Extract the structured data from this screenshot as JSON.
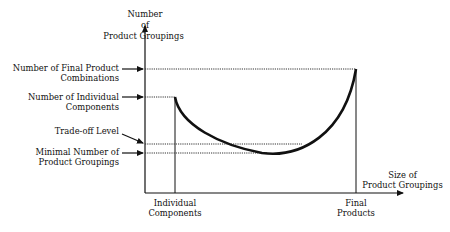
{
  "diagram": {
    "y_axis_title": [
      "Number",
      "of",
      "Product Groupings"
    ],
    "x_axis_title": [
      "Size of",
      "Product Groupings"
    ],
    "y_labels": {
      "final_combinations": [
        "Number of Final Product",
        "Combinations"
      ],
      "individual_components": [
        "Number of Individual",
        "Components"
      ],
      "tradeoff": [
        "Trade-off Level"
      ],
      "minimal": [
        "Minimal Number of",
        "Product Groupings"
      ]
    },
    "x_labels": {
      "individual_components": [
        "Individual",
        "Components"
      ],
      "final_products": [
        "Final",
        "Products"
      ]
    },
    "colors": {
      "line": "#111111",
      "background": "#ffffff"
    }
  }
}
